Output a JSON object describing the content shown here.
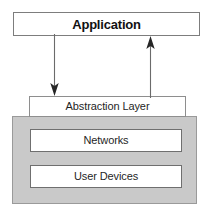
{
  "diagram": {
    "type": "layered-architecture-diagram",
    "title_text": "Application",
    "colors": {
      "panel_fill": "#c9c9c9",
      "box_fill": "#ffffff",
      "box_border": "#8e8e8e",
      "text": "#1a1a1a",
      "arrow": "#6b6b6b",
      "arrow_head": "#262626",
      "background": "#ffffff"
    },
    "layers": {
      "application": {
        "label": "Application"
      },
      "abstraction": {
        "label": "Abstraction Layer"
      },
      "infrastructure": {
        "boxes": [
          {
            "label": "Networks"
          },
          {
            "label": "User Devices"
          }
        ]
      }
    },
    "arrows": [
      {
        "name": "application-to-abstraction",
        "direction": "down",
        "from": "Application",
        "to": "Abstraction Layer"
      },
      {
        "name": "abstraction-to-application",
        "direction": "up",
        "from": "Abstraction Layer",
        "to": "Application"
      }
    ]
  }
}
